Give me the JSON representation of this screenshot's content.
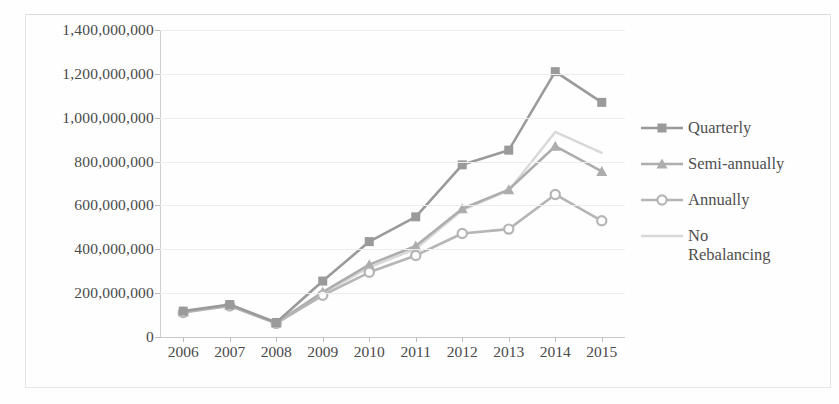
{
  "chart_data": {
    "type": "line",
    "title": "",
    "xlabel": "",
    "ylabel": "",
    "x": [
      "2006",
      "2007",
      "2008",
      "2009",
      "2010",
      "2011",
      "2012",
      "2013",
      "2014",
      "2015"
    ],
    "categories": [
      "2006",
      "2007",
      "2008",
      "2009",
      "2010",
      "2011",
      "2012",
      "2013",
      "2014",
      "2015"
    ],
    "ylim": [
      0,
      1400000000
    ],
    "ytick_step": 200000000,
    "ytick_labels": [
      "1,400,000,000",
      "1,200,000,000",
      "1,000,000,000",
      "800,000,000",
      "600,000,000",
      "400,000,000",
      "200,000,000",
      "0"
    ],
    "ytick_values": [
      1400000000,
      1200000000,
      1000000000,
      800000000,
      600000000,
      400000000,
      200000000,
      0
    ],
    "grid": true,
    "legend_position": "right",
    "series": [
      {
        "name": "Quarterly",
        "marker": "square",
        "color": "#9a9a9a",
        "values": [
          118000000,
          148000000,
          66000000,
          255000000,
          435000000,
          548000000,
          785000000,
          852000000,
          1210000000,
          1070000000
        ]
      },
      {
        "name": "Semi-annually",
        "marker": "triangle",
        "color": "#adadad",
        "values": [
          115000000,
          145000000,
          64000000,
          205000000,
          330000000,
          415000000,
          585000000,
          672000000,
          870000000,
          755000000
        ]
      },
      {
        "name": "Annually",
        "marker": "circle",
        "color": "#b5b5b5",
        "values": [
          112000000,
          142000000,
          62000000,
          190000000,
          295000000,
          372000000,
          472000000,
          492000000,
          650000000,
          530000000
        ]
      },
      {
        "name": "No Rebalancing",
        "marker": "none",
        "color": "#d8d8d8",
        "values": [
          114000000,
          144000000,
          63000000,
          198000000,
          318000000,
          402000000,
          578000000,
          668000000,
          935000000,
          840000000
        ]
      }
    ]
  },
  "legend": {
    "items": [
      {
        "label": "Quarterly"
      },
      {
        "label": "Semi-annually"
      },
      {
        "label": "Annually"
      },
      {
        "label": "No\nRebalancing"
      }
    ]
  }
}
